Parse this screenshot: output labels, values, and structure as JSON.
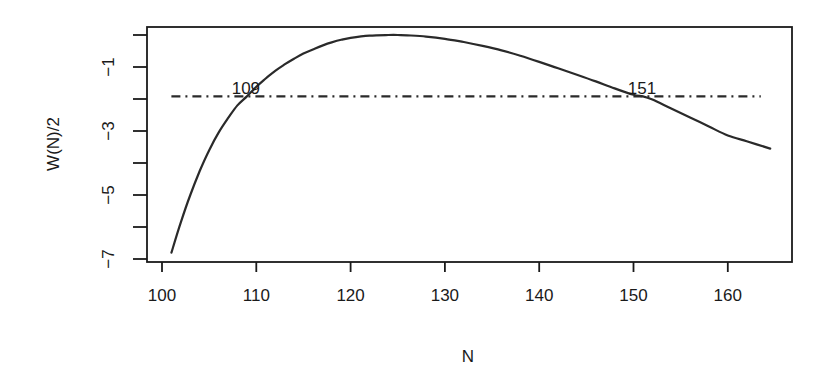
{
  "chart_data": {
    "type": "line",
    "title": "",
    "xlabel": "N",
    "ylabel": "W(N)/2",
    "xlim": [
      98.5,
      167
    ],
    "ylim": [
      -7.25,
      0.25
    ],
    "grid": false,
    "legend": null,
    "x_ticks": [
      100,
      110,
      120,
      130,
      140,
      150,
      160
    ],
    "x_tick_labels": [
      "100",
      "110",
      "120",
      "130",
      "140",
      "150",
      "160"
    ],
    "y_ticks": [
      0,
      -1,
      -2,
      -3,
      -4,
      -5,
      -6,
      -7
    ],
    "y_tick_labels": [
      "",
      "-1",
      "",
      "-3",
      "",
      "-5",
      "",
      "-7"
    ],
    "series": [
      {
        "name": "W(N)/2",
        "style": "solid",
        "x": [
          101,
          102,
          103,
          104,
          105,
          106,
          107,
          108,
          109,
          110,
          111,
          112,
          113,
          114,
          115,
          116,
          117,
          118,
          119,
          120,
          122,
          124,
          125,
          126,
          128,
          130,
          132,
          134,
          136,
          138,
          140,
          142,
          144,
          146,
          148,
          150,
          151,
          152,
          154,
          156,
          158,
          160,
          162,
          164.5
        ],
        "y": [
          -6.8,
          -5.85,
          -5.0,
          -4.25,
          -3.6,
          -3.05,
          -2.6,
          -2.2,
          -1.92,
          -1.62,
          -1.36,
          -1.12,
          -0.92,
          -0.74,
          -0.58,
          -0.45,
          -0.33,
          -0.23,
          -0.15,
          -0.09,
          -0.02,
          0.0,
          0.0,
          -0.01,
          -0.05,
          -0.12,
          -0.22,
          -0.34,
          -0.48,
          -0.65,
          -0.84,
          -1.04,
          -1.24,
          -1.45,
          -1.67,
          -1.87,
          -1.92,
          -2.02,
          -2.3,
          -2.58,
          -2.86,
          -3.14,
          -3.32,
          -3.55
        ]
      },
      {
        "name": "cutoff",
        "style": "dashdot",
        "x": [
          101,
          163.5
        ],
        "y": [
          -1.92,
          -1.92
        ]
      }
    ],
    "annotations": [
      {
        "text": "109",
        "x": 109,
        "y": -1.92
      },
      {
        "text": "151",
        "x": 151,
        "y": -1.92
      }
    ]
  }
}
